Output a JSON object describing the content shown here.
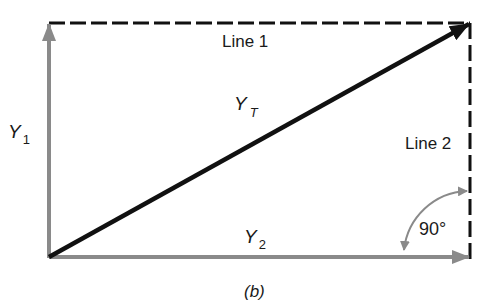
{
  "diagram": {
    "caption": "(b)",
    "colors": {
      "resultant": "#111111",
      "components": "#8a8a8a",
      "dashed": "#111111",
      "angle_arc": "#8a8a8a",
      "text": "#1a1a1a"
    },
    "labels": {
      "line1": "Line 1",
      "line2": "Line 2",
      "y1_main": "Y",
      "y1_sub": "1",
      "y2_main": "Y",
      "y2_sub": "2",
      "yt_main": "Y",
      "yt_sub": "T",
      "angle": "90°"
    },
    "vectors": [
      {
        "name": "Y1",
        "from": [
          49,
          257
        ],
        "to": [
          49,
          23
        ],
        "color": "gray"
      },
      {
        "name": "Y2",
        "from": [
          49,
          257
        ],
        "to": [
          470,
          257
        ],
        "color": "gray"
      },
      {
        "name": "YT",
        "from": [
          49,
          257
        ],
        "to": [
          470,
          23
        ],
        "color": "black"
      }
    ],
    "dashed_lines": [
      {
        "name": "Line 1",
        "from": [
          49,
          23
        ],
        "to": [
          470,
          23
        ]
      },
      {
        "name": "Line 2",
        "from": [
          470,
          23
        ],
        "to": [
          470,
          257
        ]
      }
    ],
    "angle": {
      "value_deg": 90,
      "label": "90°"
    }
  }
}
